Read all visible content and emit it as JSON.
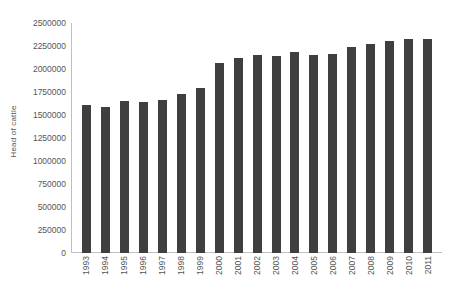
{
  "chart_data": {
    "type": "bar",
    "title": "",
    "xlabel": "",
    "ylabel": "Head of cattle",
    "categories": [
      "1993",
      "1994",
      "1995",
      "1996",
      "1997",
      "1998",
      "1999",
      "2000",
      "2001",
      "2002",
      "2003",
      "2004",
      "2005",
      "2006",
      "2007",
      "2008",
      "2009",
      "2010",
      "2011"
    ],
    "values": [
      1610000,
      1585000,
      1650000,
      1645000,
      1660000,
      1730000,
      1790000,
      2065000,
      2120000,
      2155000,
      2140000,
      2180000,
      2155000,
      2165000,
      2235000,
      2275000,
      2300000,
      2330000,
      2330000
    ],
    "series": [
      {
        "name": "Head of cattle",
        "values": [
          1610000,
          1585000,
          1650000,
          1645000,
          1660000,
          1730000,
          1790000,
          2065000,
          2120000,
          2155000,
          2140000,
          2180000,
          2155000,
          2165000,
          2235000,
          2275000,
          2300000,
          2330000,
          2330000
        ]
      }
    ],
    "ylim": [
      0,
      2500000
    ],
    "y_ticks": [
      0,
      250000,
      500000,
      750000,
      1000000,
      1250000,
      1500000,
      1750000,
      2000000,
      2250000,
      2500000
    ],
    "y_tick_labels": [
      "0",
      "250000",
      "500000",
      "750000",
      "1000000",
      "1250000",
      "1500000",
      "1750000",
      "2000000",
      "2250000",
      "2500000"
    ],
    "grid": false,
    "legend": false,
    "legend_position": "none",
    "bar_color": "#3f3f3f",
    "axis_color": "#bfbfbf",
    "text_color": "#555555",
    "background": "#ffffff",
    "x_tick_rotation": 90
  }
}
